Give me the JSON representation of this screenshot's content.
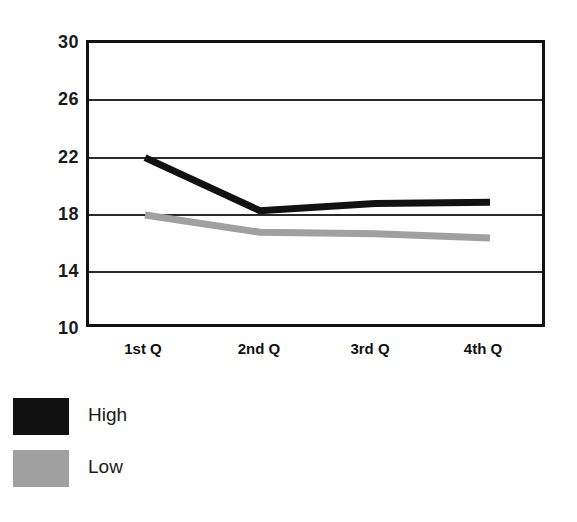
{
  "chart_data": {
    "type": "line",
    "title": "",
    "subtitle": "",
    "xlabel": "",
    "ylabel": "",
    "categories": [
      "1st Q",
      "2nd Q",
      "3rd Q",
      "4th Q"
    ],
    "series": [
      {
        "name": "High",
        "values": [
          21.8,
          18.1,
          18.6,
          18.7
        ],
        "color": "#111111"
      },
      {
        "name": "Low",
        "values": [
          17.8,
          16.6,
          16.5,
          16.2
        ],
        "color": "#a0a0a0"
      }
    ],
    "ylim": [
      10,
      30
    ],
    "yticks": [
      10,
      14,
      18,
      22,
      26,
      30
    ],
    "ytick_labels": [
      "10",
      "14",
      "18",
      "22",
      "26",
      "30"
    ],
    "grid": true,
    "grid_axis": "y",
    "legend_position": "bottom-left",
    "background": "#ffffff",
    "frame_color": "#111111"
  },
  "axes": {
    "y_labels": [
      "30",
      "26",
      "22",
      "18",
      "14",
      "10"
    ],
    "x_labels": [
      "1st Q",
      "2nd Q",
      "3rd Q",
      "4th Q"
    ]
  },
  "legend": {
    "items": [
      {
        "label": "High",
        "color": "#111111"
      },
      {
        "label": "Low",
        "color": "#a0a0a0"
      }
    ]
  }
}
